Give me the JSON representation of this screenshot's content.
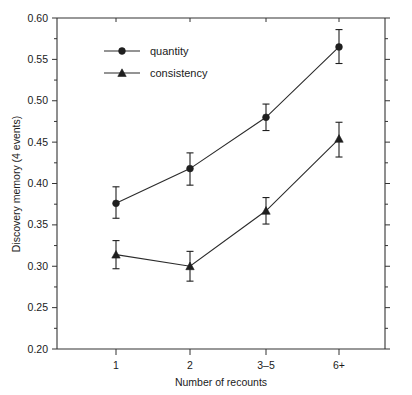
{
  "chart_data": {
    "type": "line",
    "title": "",
    "xlabel": "Number of recounts",
    "ylabel": "Discovery memory (4 events)",
    "categories": [
      "1",
      "2",
      "3–5",
      "6+"
    ],
    "ylim": [
      0.2,
      0.6
    ],
    "ytick_step": 0.05,
    "ytick_labels": [
      "0.20",
      "0.25",
      "0.30",
      "0.35",
      "0.40",
      "0.45",
      "0.50",
      "0.55",
      "0.60"
    ],
    "ytick_values": [
      0.2,
      0.25,
      0.3,
      0.35,
      0.4,
      0.45,
      0.5,
      0.55,
      0.6
    ],
    "minor_ticks": true,
    "grid": false,
    "legend_position": "upper-left-inside",
    "error_bar_type": "standard error",
    "series": [
      {
        "name": "quantity",
        "marker": "circle",
        "values": [
          0.376,
          0.418,
          0.48,
          0.565
        ],
        "err_low": [
          0.358,
          0.398,
          0.464,
          0.545
        ],
        "err_high": [
          0.396,
          0.437,
          0.496,
          0.586
        ]
      },
      {
        "name": "consistency",
        "marker": "triangle",
        "values": [
          0.314,
          0.3,
          0.367,
          0.454
        ],
        "err_low": [
          0.297,
          0.282,
          0.351,
          0.432
        ],
        "err_high": [
          0.331,
          0.318,
          0.383,
          0.474
        ]
      }
    ]
  },
  "legend": {
    "entries": [
      {
        "label": "quantity",
        "marker": "circle"
      },
      {
        "label": "consistency",
        "marker": "triangle"
      }
    ]
  },
  "colors": {
    "line": "#2b2b2b",
    "marker": "#1f1f1f",
    "axis": "#333333",
    "text": "#1a1a1a",
    "background": "#ffffff"
  }
}
